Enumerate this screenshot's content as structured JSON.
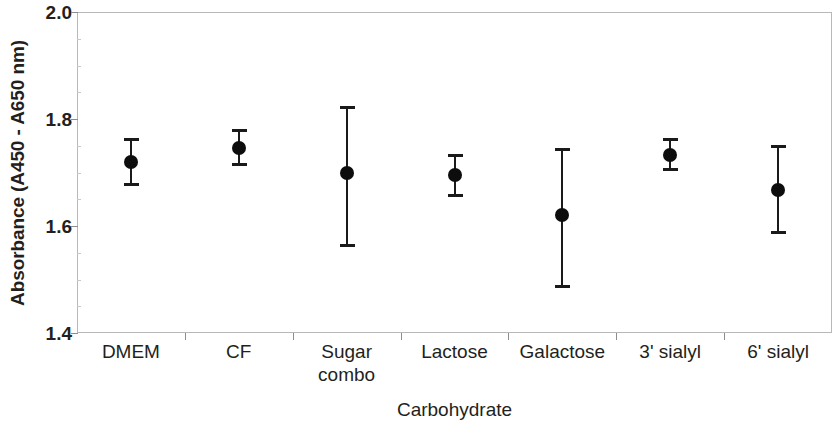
{
  "chart_data": {
    "type": "scatter",
    "title": "",
    "xlabel": "Carbohydrate",
    "ylabel": "Absorbance (A450 - A650 nm)",
    "categories": [
      "DMEM",
      "CF",
      "Sugar\ncombo",
      "Lactose",
      "Galactose",
      "3' sialyl",
      "6' sialyl"
    ],
    "values": [
      1.72,
      1.745,
      1.7,
      1.695,
      1.62,
      1.733,
      1.667
    ],
    "error_low": [
      1.675,
      1.712,
      1.56,
      1.655,
      1.485,
      1.702,
      1.585
    ],
    "error_high": [
      1.765,
      1.782,
      1.825,
      1.735,
      1.745,
      1.765,
      1.752
    ],
    "ylim": [
      1.4,
      2.0
    ],
    "ytick_labels": [
      "2.0",
      "1.8",
      "1.6",
      "1.4"
    ],
    "ytick_values": [
      2.0,
      1.8,
      1.6,
      1.4
    ],
    "yminor_step": 0.05,
    "grid": false,
    "legend": "none",
    "marker_color": "#0d0d0d",
    "axis_color": "#b8b8b8",
    "series": [
      {
        "name": "Absorbance",
        "points": [
          {
            "category": "DMEM",
            "value": 1.72,
            "low": 1.675,
            "high": 1.765
          },
          {
            "category": "CF",
            "value": 1.745,
            "low": 1.712,
            "high": 1.782
          },
          {
            "category": "Sugar combo",
            "value": 1.7,
            "low": 1.56,
            "high": 1.825
          },
          {
            "category": "Lactose",
            "value": 1.695,
            "low": 1.655,
            "high": 1.735
          },
          {
            "category": "Galactose",
            "value": 1.62,
            "low": 1.485,
            "high": 1.745
          },
          {
            "category": "3' sialyl",
            "value": 1.733,
            "low": 1.702,
            "high": 1.765
          },
          {
            "category": "6' sialyl",
            "value": 1.667,
            "low": 1.585,
            "high": 1.752
          }
        ]
      }
    ]
  }
}
